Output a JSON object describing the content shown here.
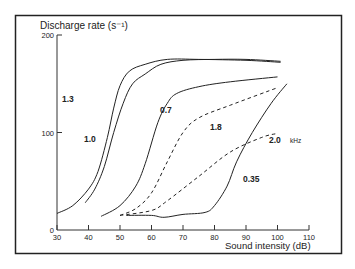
{
  "chart_data": {
    "type": "line",
    "title": "",
    "ylabel": "Discharge rate (s⁻¹)",
    "xlabel": "Sound intensity (dB)",
    "xlim": [
      30,
      110
    ],
    "ylim": [
      0,
      200
    ],
    "x_ticks": [
      30,
      40,
      50,
      60,
      70,
      80,
      90,
      100,
      110
    ],
    "y_ticks": [
      0,
      100,
      200
    ],
    "grid": false,
    "legend": "inline curve labels",
    "unit_annotation": "kHz",
    "series": [
      {
        "name": "1.3",
        "style": "solid",
        "x": [
          30,
          35,
          40,
          43,
          46,
          48,
          50,
          53,
          58,
          65,
          75,
          90,
          101
        ],
        "y": [
          17,
          25,
          42,
          60,
          95,
          125,
          148,
          163,
          170,
          175,
          175,
          174,
          172
        ]
      },
      {
        "name": "1.0",
        "style": "solid",
        "x": [
          39,
          42,
          45,
          48,
          51,
          54,
          58,
          63,
          70,
          80,
          90,
          101
        ],
        "y": [
          28,
          42,
          65,
          100,
          130,
          150,
          160,
          170,
          174,
          175,
          175,
          173
        ]
      },
      {
        "name": "0.7",
        "style": "solid",
        "x": [
          44,
          50,
          55,
          58,
          62,
          65,
          68,
          75,
          85,
          100
        ],
        "y": [
          14,
          25,
          45,
          68,
          110,
          130,
          140,
          147,
          152,
          157
        ]
      },
      {
        "name": "1.8",
        "style": "dashed",
        "x": [
          50,
          55,
          60,
          65,
          70,
          75,
          85,
          100
        ],
        "y": [
          15,
          22,
          38,
          70,
          100,
          115,
          128,
          146
        ]
      },
      {
        "name": "2.0",
        "style": "dashed",
        "x": [
          50,
          60,
          65,
          75,
          85,
          95,
          100
        ],
        "y": [
          15,
          20,
          30,
          55,
          80,
          95,
          99
        ]
      },
      {
        "name": "0.35",
        "style": "solid",
        "x": [
          52,
          60,
          64,
          70,
          77,
          80,
          84,
          87,
          92,
          98,
          103
        ],
        "y": [
          15,
          15,
          13,
          16,
          18,
          25,
          45,
          70,
          100,
          130,
          150
        ]
      }
    ],
    "labels": [
      {
        "text": "1.3",
        "x": 62,
        "y": 102
      },
      {
        "text": "1.0",
        "x": 84,
        "y": 142
      },
      {
        "text": "0.7",
        "x": 160,
        "y": 113
      },
      {
        "text": "1.8",
        "x": 210,
        "y": 130
      },
      {
        "text": "2.0",
        "x": 269,
        "y": 143
      },
      {
        "text": "kHz",
        "x": 290,
        "y": 143
      },
      {
        "text": "0.35",
        "x": 243,
        "y": 182
      }
    ]
  },
  "frame": {
    "border_color": "#222222",
    "line_color": "#333333"
  }
}
